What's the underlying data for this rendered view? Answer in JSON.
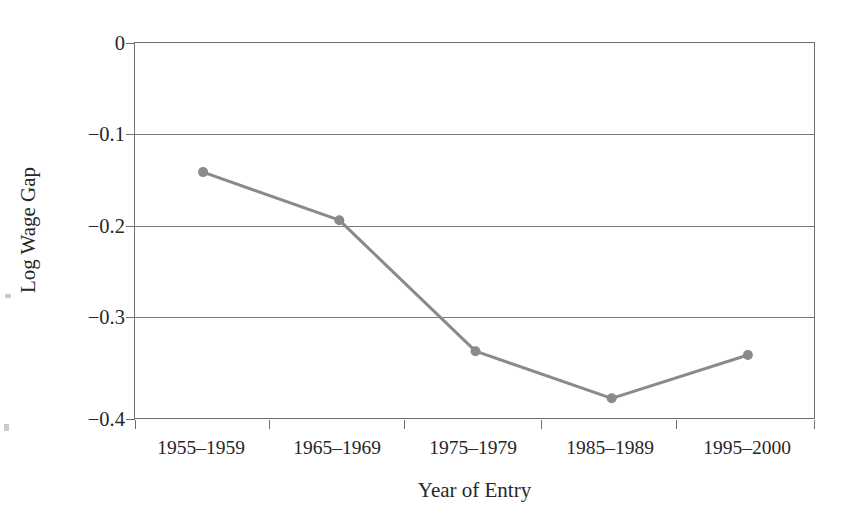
{
  "figure": {
    "background_color": "#ffffff",
    "frame_color": "#6e6e6e",
    "series_color": "#8a8a8a",
    "text_color": "#272727"
  },
  "chart_data": {
    "type": "line",
    "title": "",
    "xlabel": "Year of Entry",
    "ylabel": "Log Wage Gap",
    "categories": [
      "1955–1959",
      "1965–1969",
      "1975–1979",
      "1985–1989",
      "1995–2000"
    ],
    "values": [
      -0.137,
      -0.188,
      -0.327,
      -0.377,
      -0.331
    ],
    "series": [
      {
        "name": "Log Wage Gap",
        "values": [
          -0.137,
          -0.188,
          -0.327,
          -0.377,
          -0.331
        ]
      }
    ],
    "ylim": [
      -0.4,
      0.0
    ],
    "yticks": [
      0,
      -0.1,
      -0.2,
      -0.3,
      -0.4
    ],
    "ytick_labels": [
      "0",
      "−0.1",
      "−0.2",
      "−0.3",
      "−0.4"
    ],
    "grid": true,
    "grid_axis": "y",
    "legend": false,
    "legend_position": "none",
    "marker": "circle",
    "marker_size": 7,
    "line_width": 3
  },
  "axis": {
    "y_title": "Log Wage Gap",
    "x_title": "Year of Entry",
    "y_tick_0": "0",
    "y_tick_1": "−0.1",
    "y_tick_2": "−0.2",
    "y_tick_3": "−0.3",
    "y_tick_4": "−0.4",
    "x_tick_0": "1955–1959",
    "x_tick_1": "1965–1969",
    "x_tick_2": "1975–1979",
    "x_tick_3": "1985–1989",
    "x_tick_4": "1995–2000"
  }
}
